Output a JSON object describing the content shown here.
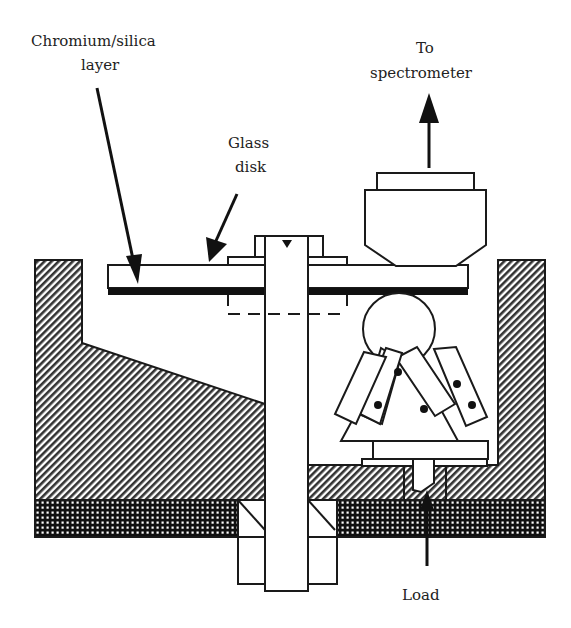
{
  "labels": {
    "chromium_line1": "Chromium/silica",
    "chromium_line2": "layer",
    "glass_line1": "Glass",
    "glass_line2": "disk",
    "spectro_line1": "To",
    "spectro_line2": "spectrometer",
    "load": "Load"
  },
  "colors": {
    "ink": "#1a1a1a",
    "background": "#ffffff"
  }
}
